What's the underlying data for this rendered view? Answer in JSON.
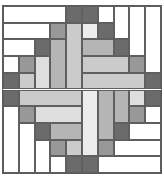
{
  "quilt": {
    "grid": {
      "cols": 10,
      "rows": 10
    },
    "shades": {
      "white": "#ffffff",
      "lightest": "#ececec",
      "lighter": "#dedede",
      "light": "#cbcbcb",
      "medlight": "#b5b5b5",
      "medium": "#989898",
      "dark": "#6b6b6b"
    },
    "pieces": [
      {
        "c": 0,
        "r": 0,
        "w": 4,
        "h": 1,
        "s": "white"
      },
      {
        "c": 4,
        "r": 0,
        "w": 1,
        "h": 1,
        "s": "dark"
      },
      {
        "c": 0,
        "r": 1,
        "w": 3,
        "h": 1,
        "s": "white"
      },
      {
        "c": 3,
        "r": 1,
        "w": 1,
        "h": 1,
        "s": "medium"
      },
      {
        "c": 4,
        "r": 1,
        "w": 1,
        "h": 4,
        "s": "light"
      },
      {
        "c": 0,
        "r": 2,
        "w": 2,
        "h": 1,
        "s": "white"
      },
      {
        "c": 2,
        "r": 2,
        "w": 1,
        "h": 1,
        "s": "dark"
      },
      {
        "c": 3,
        "r": 2,
        "w": 1,
        "h": 3,
        "s": "medlight"
      },
      {
        "c": 0,
        "r": 3,
        "w": 1,
        "h": 1,
        "s": "white"
      },
      {
        "c": 1,
        "r": 3,
        "w": 1,
        "h": 1,
        "s": "medium"
      },
      {
        "c": 2,
        "r": 3,
        "w": 1,
        "h": 2,
        "s": "lighter"
      },
      {
        "c": 0,
        "r": 4,
        "w": 1,
        "h": 1,
        "s": "dark"
      },
      {
        "c": 1,
        "r": 4,
        "w": 1,
        "h": 1,
        "s": "light"
      },
      {
        "c": 5,
        "r": 0,
        "w": 1,
        "h": 1,
        "s": "dark"
      },
      {
        "c": 6,
        "r": 0,
        "w": 1,
        "h": 1,
        "s": "white"
      },
      {
        "c": 7,
        "r": 0,
        "w": 1,
        "h": 2,
        "s": "white"
      },
      {
        "c": 8,
        "r": 0,
        "w": 1,
        "h": 3,
        "s": "white"
      },
      {
        "c": 9,
        "r": 0,
        "w": 1,
        "h": 4,
        "s": "white"
      },
      {
        "c": 5,
        "r": 1,
        "w": 1,
        "h": 1,
        "s": "lightest"
      },
      {
        "c": 6,
        "r": 1,
        "w": 1,
        "h": 1,
        "s": "dark"
      },
      {
        "c": 5,
        "r": 2,
        "w": 2,
        "h": 1,
        "s": "medlight"
      },
      {
        "c": 7,
        "r": 2,
        "w": 1,
        "h": 1,
        "s": "dark"
      },
      {
        "c": 5,
        "r": 3,
        "w": 3,
        "h": 1,
        "s": "light"
      },
      {
        "c": 8,
        "r": 3,
        "w": 1,
        "h": 1,
        "s": "medium"
      },
      {
        "c": 5,
        "r": 4,
        "w": 4,
        "h": 1,
        "s": "light"
      },
      {
        "c": 9,
        "r": 4,
        "w": 1,
        "h": 1,
        "s": "dark"
      },
      {
        "c": 0,
        "r": 5,
        "w": 1,
        "h": 1,
        "s": "dark"
      },
      {
        "c": 1,
        "r": 5,
        "w": 4,
        "h": 1,
        "s": "light"
      },
      {
        "c": 0,
        "r": 6,
        "w": 1,
        "h": 4,
        "s": "white"
      },
      {
        "c": 1,
        "r": 6,
        "w": 1,
        "h": 1,
        "s": "medium"
      },
      {
        "c": 2,
        "r": 6,
        "w": 3,
        "h": 1,
        "s": "lighter"
      },
      {
        "c": 1,
        "r": 7,
        "w": 1,
        "h": 3,
        "s": "white"
      },
      {
        "c": 2,
        "r": 7,
        "w": 1,
        "h": 1,
        "s": "dark"
      },
      {
        "c": 3,
        "r": 7,
        "w": 2,
        "h": 1,
        "s": "medlight"
      },
      {
        "c": 2,
        "r": 8,
        "w": 1,
        "h": 2,
        "s": "white"
      },
      {
        "c": 3,
        "r": 8,
        "w": 1,
        "h": 1,
        "s": "medium"
      },
      {
        "c": 4,
        "r": 8,
        "w": 1,
        "h": 1,
        "s": "light"
      },
      {
        "c": 3,
        "r": 9,
        "w": 1,
        "h": 1,
        "s": "white"
      },
      {
        "c": 4,
        "r": 9,
        "w": 1,
        "h": 1,
        "s": "dark"
      },
      {
        "c": 5,
        "r": 5,
        "w": 1,
        "h": 4,
        "s": "lightest"
      },
      {
        "c": 5,
        "r": 9,
        "w": 1,
        "h": 1,
        "s": "dark"
      },
      {
        "c": 6,
        "r": 5,
        "w": 1,
        "h": 3,
        "s": "medlight"
      },
      {
        "c": 6,
        "r": 8,
        "w": 1,
        "h": 1,
        "s": "medium"
      },
      {
        "c": 6,
        "r": 9,
        "w": 4,
        "h": 1,
        "s": "white"
      },
      {
        "c": 7,
        "r": 5,
        "w": 1,
        "h": 2,
        "s": "medlight"
      },
      {
        "c": 7,
        "r": 7,
        "w": 1,
        "h": 1,
        "s": "dark"
      },
      {
        "c": 7,
        "r": 8,
        "w": 3,
        "h": 1,
        "s": "white"
      },
      {
        "c": 8,
        "r": 5,
        "w": 1,
        "h": 1,
        "s": "lighter"
      },
      {
        "c": 8,
        "r": 6,
        "w": 1,
        "h": 1,
        "s": "medium"
      },
      {
        "c": 8,
        "r": 7,
        "w": 2,
        "h": 1,
        "s": "white"
      },
      {
        "c": 9,
        "r": 5,
        "w": 1,
        "h": 1,
        "s": "dark"
      },
      {
        "c": 9,
        "r": 6,
        "w": 1,
        "h": 1,
        "s": "white"
      }
    ]
  }
}
